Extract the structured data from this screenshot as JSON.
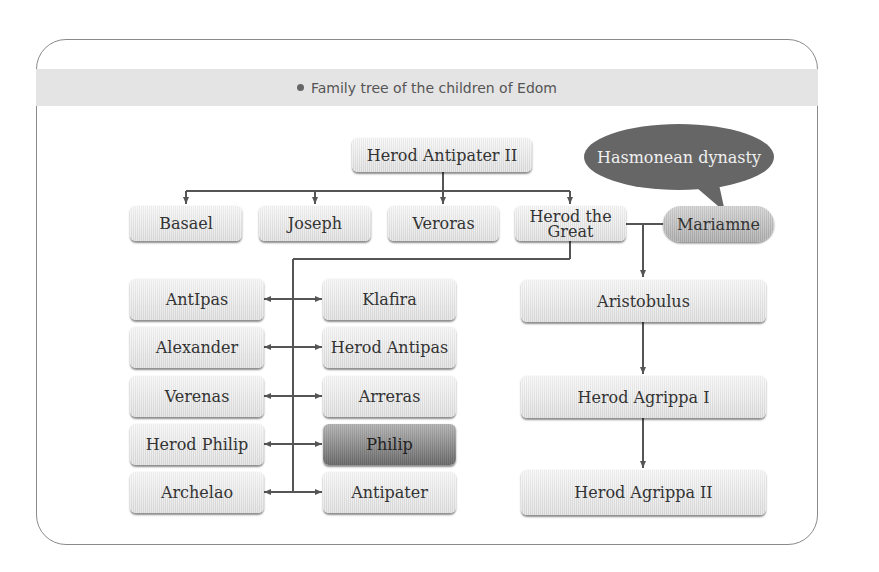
{
  "title": "Family tree of the children of Edom",
  "colors": {
    "line": "#555555",
    "bubble": "#666666",
    "header_bar": "#e4e4e4",
    "highlight_box": "#7a7a7a"
  },
  "root": "Herod Antipater II",
  "annotation": "Hasmonean dynasty",
  "generation2": [
    "Basael",
    "Joseph",
    "Veroras",
    "Herod the Great"
  ],
  "spouse": "Mariamne",
  "herod_children_left": [
    "AntIpas",
    "Alexander",
    "Verenas",
    "Herod Philip",
    "Archelao"
  ],
  "herod_children_right": [
    "Klafira",
    "Herod Antipas",
    "Arreras",
    "Philip",
    "Antipater"
  ],
  "hasmonean_line": [
    "Aristobulus",
    "Herod Agrippa I",
    "Herod Agrippa II"
  ]
}
